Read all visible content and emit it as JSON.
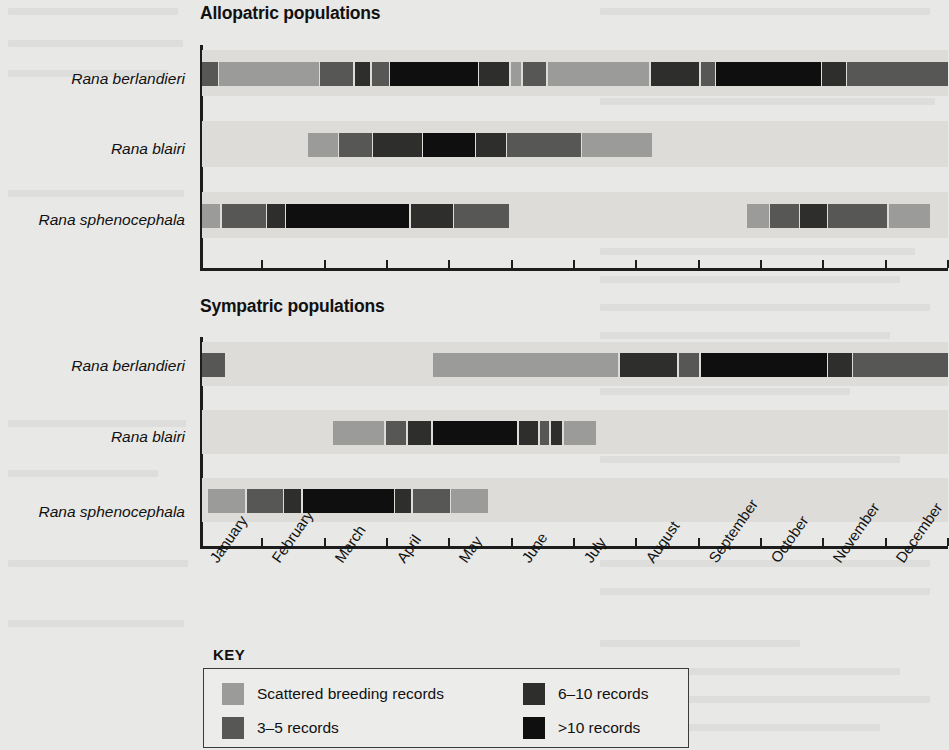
{
  "figure": {
    "panels": [
      {
        "id": "allopatric",
        "title": "Allopatric populations"
      },
      {
        "id": "sympatric",
        "title": "Sympatric populations"
      }
    ],
    "species": [
      "Rana berlandieri",
      "Rana blairi",
      "Rana sphenocephala"
    ],
    "months": [
      "January",
      "February",
      "March",
      "April",
      "May",
      "June",
      "July",
      "August",
      "September",
      "October",
      "November",
      "December"
    ]
  },
  "key": {
    "title": "KEY",
    "items": [
      {
        "label": "Scattered breeding records",
        "color": "#9b9b99"
      },
      {
        "label": "3–5 records",
        "color": "#575756"
      },
      {
        "label": "6–10 records",
        "color": "#2e2e2d"
      },
      {
        "label": ">10 records",
        "color": "#0f0f0f"
      }
    ]
  },
  "colors": {
    "scattered": "#9b9b99",
    "r3_5": "#575756",
    "r6_10": "#2e2e2d",
    "r10plus": "#0f0f0f",
    "band": "#dddcd9",
    "background": "#e8e8e6",
    "axis": "#1d1d1d"
  },
  "chart_data": {
    "type": "bar",
    "subtype": "horizontal-gantt-intensity",
    "xlabel": "",
    "ylabel": "",
    "x_unit": "month",
    "xlim": [
      0,
      12
    ],
    "categories": [
      "January",
      "February",
      "March",
      "April",
      "May",
      "June",
      "July",
      "August",
      "September",
      "October",
      "November",
      "December"
    ],
    "grid": false,
    "legend_position": "bottom-left",
    "legend_entries": [
      "Scattered breeding records",
      "3–5 records",
      "6–10 records",
      ">10 records"
    ],
    "intensity_levels": {
      "scattered": "Scattered breeding records",
      "3-5": "3–5 records",
      "6-10": "6–10 records",
      ">10": ">10 records"
    },
    "panels": [
      {
        "name": "Allopatric populations",
        "rows": [
          {
            "species": "Rana berlandieri",
            "segments": [
              {
                "start": 0.0,
                "end": 0.28,
                "level": "3-5"
              },
              {
                "start": 0.28,
                "end": 1.9,
                "level": "scattered"
              },
              {
                "start": 1.9,
                "end": 2.45,
                "level": "3-5"
              },
              {
                "start": 2.45,
                "end": 2.72,
                "level": "6-10"
              },
              {
                "start": 2.72,
                "end": 3.02,
                "level": "3-5"
              },
              {
                "start": 3.02,
                "end": 4.45,
                "level": ">10"
              },
              {
                "start": 4.45,
                "end": 4.95,
                "level": "6-10"
              },
              {
                "start": 4.95,
                "end": 5.15,
                "level": "scattered"
              },
              {
                "start": 5.15,
                "end": 5.55,
                "level": "3-5"
              },
              {
                "start": 5.55,
                "end": 7.2,
                "level": "scattered"
              },
              {
                "start": 7.2,
                "end": 8.0,
                "level": "6-10"
              },
              {
                "start": 8.0,
                "end": 8.25,
                "level": "3-5"
              },
              {
                "start": 8.25,
                "end": 9.95,
                "level": ">10"
              },
              {
                "start": 9.95,
                "end": 10.35,
                "level": "6-10"
              },
              {
                "start": 10.35,
                "end": 12.0,
                "level": "3-5"
              }
            ]
          },
          {
            "species": "Rana blairi",
            "segments": [
              {
                "start": 1.7,
                "end": 2.2,
                "level": "scattered"
              },
              {
                "start": 2.2,
                "end": 2.75,
                "level": "3-5"
              },
              {
                "start": 2.75,
                "end": 3.55,
                "level": "6-10"
              },
              {
                "start": 3.55,
                "end": 4.4,
                "level": ">10"
              },
              {
                "start": 4.4,
                "end": 4.9,
                "level": "6-10"
              },
              {
                "start": 4.9,
                "end": 6.1,
                "level": "3-5"
              },
              {
                "start": 6.1,
                "end": 7.25,
                "level": "scattered"
              }
            ]
          },
          {
            "species": "Rana sphenocephala",
            "segments": [
              {
                "start": 0.0,
                "end": 0.32,
                "level": "scattered"
              },
              {
                "start": 0.32,
                "end": 1.05,
                "level": "3-5"
              },
              {
                "start": 1.05,
                "end": 1.35,
                "level": "6-10"
              },
              {
                "start": 1.35,
                "end": 3.35,
                "level": ">10"
              },
              {
                "start": 3.35,
                "end": 4.05,
                "level": "6-10"
              },
              {
                "start": 4.05,
                "end": 4.95,
                "level": "3-5"
              },
              {
                "start": 8.75,
                "end": 9.12,
                "level": "scattered"
              },
              {
                "start": 9.12,
                "end": 9.6,
                "level": "3-5"
              },
              {
                "start": 9.6,
                "end": 10.05,
                "level": "6-10"
              },
              {
                "start": 10.05,
                "end": 11.02,
                "level": "3-5"
              },
              {
                "start": 11.02,
                "end": 11.7,
                "level": "scattered"
              }
            ]
          }
        ]
      },
      {
        "name": "Sympatric populations",
        "rows": [
          {
            "species": "Rana berlandieri",
            "segments": [
              {
                "start": 0.0,
                "end": 0.4,
                "level": "3-5"
              },
              {
                "start": 3.7,
                "end": 6.7,
                "level": "scattered"
              },
              {
                "start": 6.7,
                "end": 7.65,
                "level": "6-10"
              },
              {
                "start": 7.65,
                "end": 8.0,
                "level": "3-5"
              },
              {
                "start": 8.0,
                "end": 10.05,
                "level": ">10"
              },
              {
                "start": 10.05,
                "end": 10.45,
                "level": "6-10"
              },
              {
                "start": 10.45,
                "end": 12.0,
                "level": "3-5"
              }
            ]
          },
          {
            "species": "Rana blairi",
            "segments": [
              {
                "start": 2.1,
                "end": 2.95,
                "level": "scattered"
              },
              {
                "start": 2.95,
                "end": 3.3,
                "level": "3-5"
              },
              {
                "start": 3.3,
                "end": 3.7,
                "level": "6-10"
              },
              {
                "start": 3.7,
                "end": 5.08,
                "level": ">10"
              },
              {
                "start": 5.08,
                "end": 5.42,
                "level": "6-10"
              },
              {
                "start": 5.42,
                "end": 5.6,
                "level": "3-5"
              },
              {
                "start": 5.6,
                "end": 5.8,
                "level": "6-10"
              },
              {
                "start": 5.8,
                "end": 6.35,
                "level": "scattered"
              }
            ]
          },
          {
            "species": "Rana sphenocephala",
            "segments": [
              {
                "start": 0.1,
                "end": 0.72,
                "level": "scattered"
              },
              {
                "start": 0.72,
                "end": 1.32,
                "level": "3-5"
              },
              {
                "start": 1.32,
                "end": 1.62,
                "level": "6-10"
              },
              {
                "start": 1.62,
                "end": 3.1,
                "level": ">10"
              },
              {
                "start": 3.1,
                "end": 3.38,
                "level": "6-10"
              },
              {
                "start": 3.38,
                "end": 4.0,
                "level": "3-5"
              },
              {
                "start": 4.0,
                "end": 4.62,
                "level": "scattered"
              }
            ]
          }
        ]
      }
    ]
  }
}
